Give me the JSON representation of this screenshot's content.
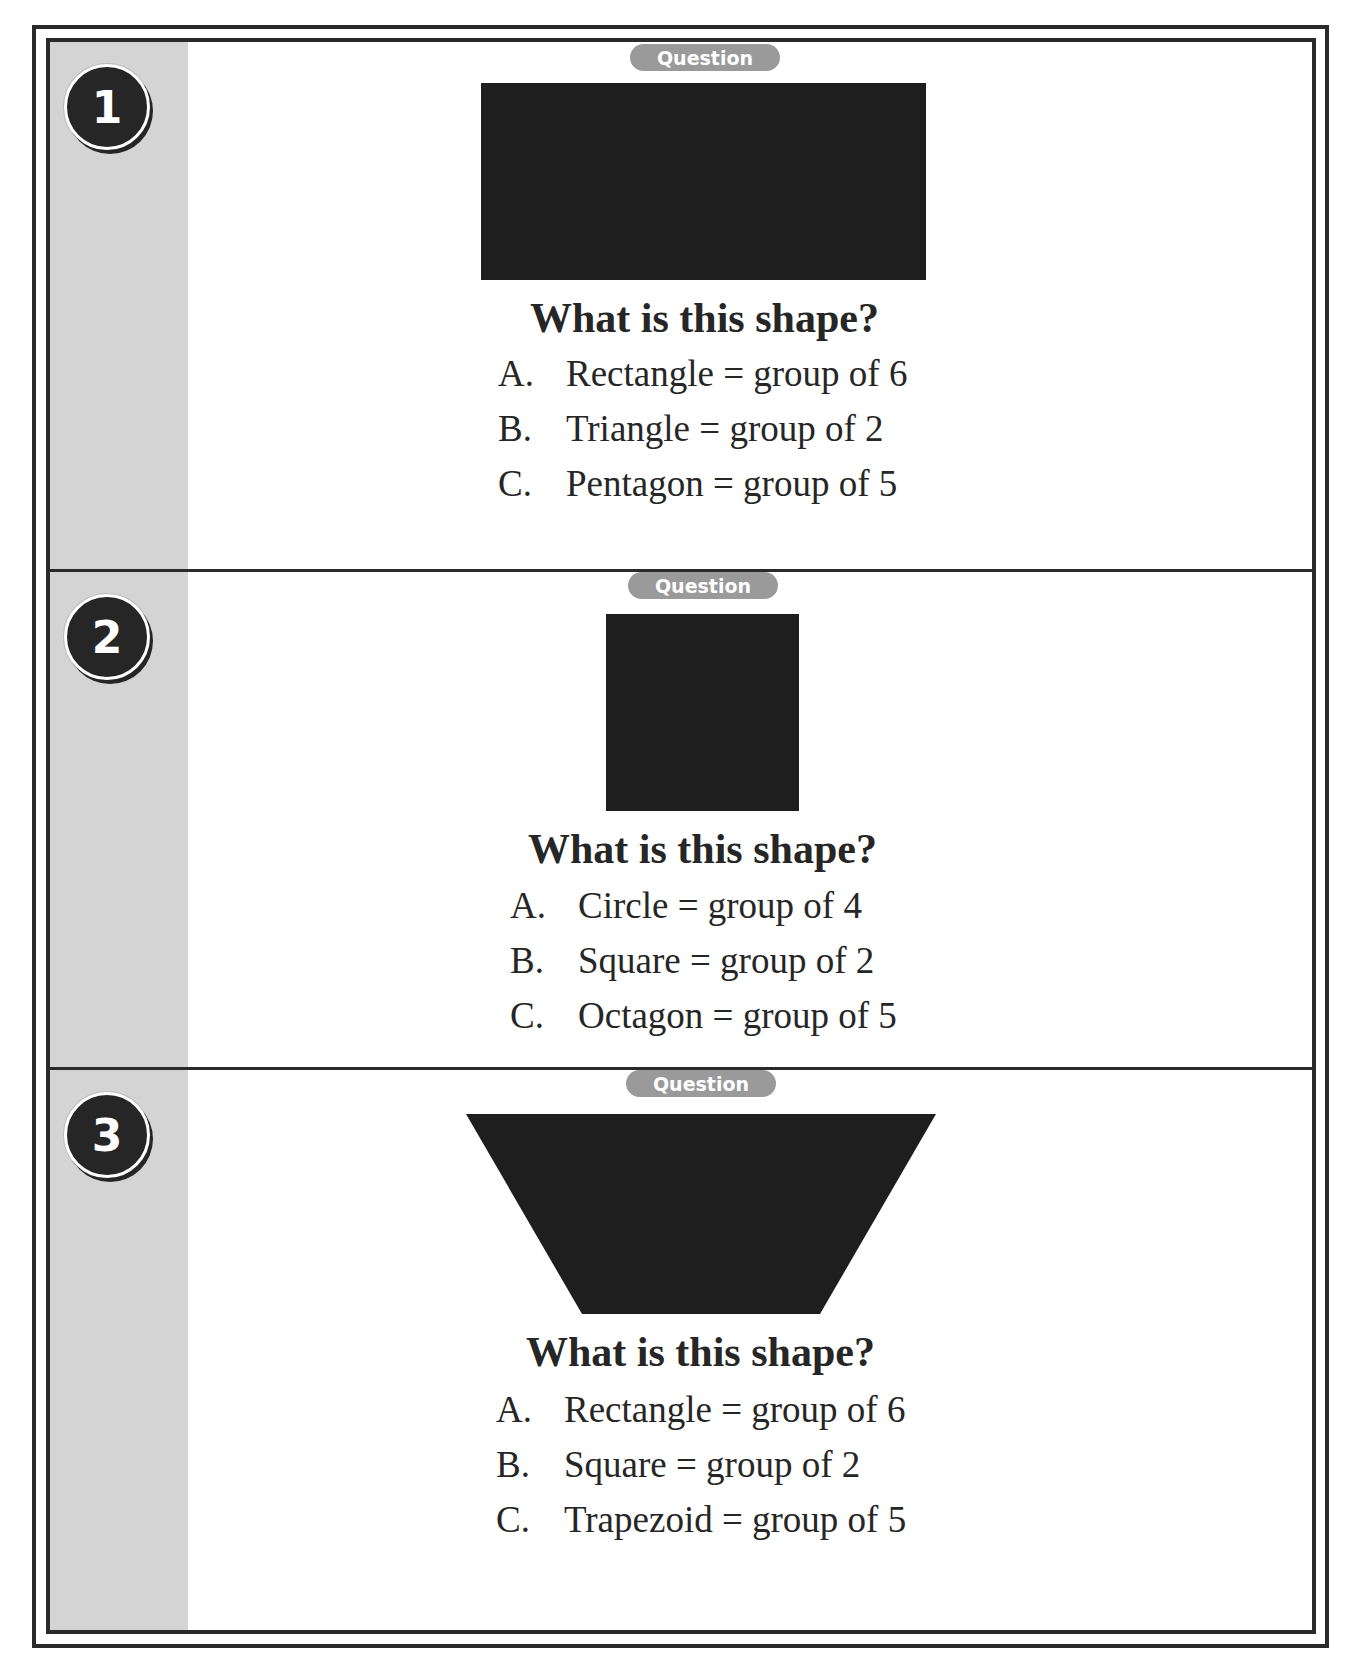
{
  "tag_label": "Question",
  "questions": [
    {
      "number": "1",
      "shape": "rectangle",
      "prompt": "What is this shape?",
      "options": [
        {
          "letter": "A.",
          "text": "Rectangle = group of 6"
        },
        {
          "letter": "B.",
          "text": "Triangle = group of 2"
        },
        {
          "letter": "C.",
          "text": "Pentagon = group of 5"
        }
      ]
    },
    {
      "number": "2",
      "shape": "square",
      "prompt": "What is this shape?",
      "options": [
        {
          "letter": "A.",
          "text": "Circle = group of 4"
        },
        {
          "letter": "B.",
          "text": "Square = group of 2"
        },
        {
          "letter": "C.",
          "text": "Octagon = group of 5"
        }
      ]
    },
    {
      "number": "3",
      "shape": "trapezoid",
      "prompt": "What is this shape?",
      "options": [
        {
          "letter": "A.",
          "text": "Rectangle = group of 6"
        },
        {
          "letter": "B.",
          "text": "Square = group of 2"
        },
        {
          "letter": "C.",
          "text": "Trapezoid = group of 5"
        }
      ]
    }
  ],
  "colors": {
    "ink": "#262626",
    "stripe": "#d4d4d4",
    "tag": "#9a9a9a"
  }
}
